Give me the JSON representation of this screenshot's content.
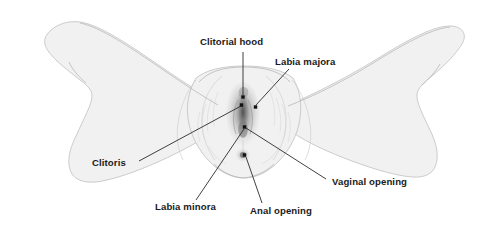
{
  "figure": {
    "background_color": "#ffffff",
    "width": 488,
    "height": 229,
    "illustration_style": "pencil line drawing, light gray shading",
    "body_fill_color": "#f1f1f1",
    "body_outline_color": "#b9b9b9",
    "label_color": "#1a1a1a",
    "leader_line_color": "#2b2b2b",
    "anchor_dot_color": "#111111"
  },
  "labels": [
    {
      "id": "clitorial-hood",
      "text": "Clitorial hood",
      "text_x": 200,
      "text_y": 45,
      "anchor": "start",
      "dot_x": 243,
      "dot_y": 97,
      "leader_points": "243,52 243,95"
    },
    {
      "id": "labia-majora",
      "text": "Labia majora",
      "text_x": 275,
      "text_y": 65,
      "anchor": "start",
      "dot_x": 255.5,
      "dot_y": 107,
      "leader_points": "289,69 256,105"
    },
    {
      "id": "clitoris",
      "text": "Clitoris",
      "text_x": 92,
      "text_y": 166,
      "anchor": "start",
      "dot_x": 241.5,
      "dot_y": 105,
      "leader_points": "139,161 241,106"
    },
    {
      "id": "labia-minora",
      "text": "Labia minora",
      "text_x": 155,
      "text_y": 210,
      "anchor": "start",
      "dot_x": 244.5,
      "dot_y": 127,
      "leader_points": "196,200 244,129"
    },
    {
      "id": "anal-opening",
      "text": "Anal opening",
      "text_x": 250,
      "text_y": 214,
      "anchor": "start",
      "dot_x": 244.5,
      "dot_y": 155,
      "leader_points": "262,203 246,157"
    },
    {
      "id": "vaginal-opening",
      "text": "Vaginal opening",
      "text_x": 332,
      "text_y": 185,
      "anchor": "start",
      "dot_x": 244.5,
      "dot_y": 127,
      "leader_points": "326,179 246,128"
    }
  ]
}
